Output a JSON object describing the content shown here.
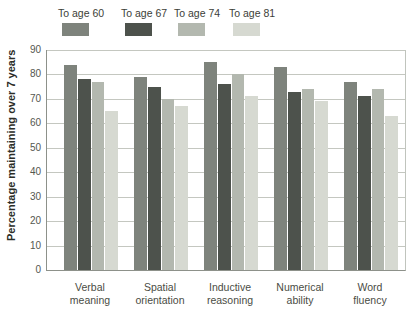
{
  "chart_data": {
    "type": "bar",
    "title": "",
    "ylabel": "Percentage maintaining over 7 years",
    "ylim": [
      0,
      90
    ],
    "ytick_values": [
      0,
      10,
      20,
      30,
      40,
      50,
      60,
      70,
      80,
      90
    ],
    "grid": "horizontal",
    "legend_position": "top",
    "categories": [
      {
        "line1": "Verbal",
        "line2": "meaning"
      },
      {
        "line1": "Spatial",
        "line2": "orientation"
      },
      {
        "line1": "Inductive",
        "line2": "reasoning"
      },
      {
        "line1": "Numerical",
        "line2": "ability"
      },
      {
        "line1": "Word",
        "line2": "fluency"
      }
    ],
    "series": [
      {
        "name": "To age 60",
        "color": "#7e837c",
        "values": [
          84,
          79,
          85,
          83,
          77
        ]
      },
      {
        "name": "To age 67",
        "color": "#4d524c",
        "values": [
          78,
          75,
          76,
          73,
          71
        ]
      },
      {
        "name": "To age 74",
        "color": "#b3b8af",
        "values": [
          77,
          70,
          80,
          74,
          74
        ]
      },
      {
        "name": "To age 81",
        "color": "#d6d9d1",
        "values": [
          65,
          67,
          71,
          69,
          63
        ]
      }
    ]
  },
  "colors": {
    "gridline": "#c4c7c0",
    "axis": "#8d918a",
    "tick_text": "#55574f",
    "label_text": "#4a4c44"
  },
  "layout_hints": {
    "legend_lefts_px": [
      58,
      121,
      174,
      229
    ],
    "group_lefts_px": [
      17,
      87,
      157,
      227,
      297
    ],
    "plot": {
      "left": 46,
      "top": 50,
      "width": 358,
      "height": 220
    }
  }
}
